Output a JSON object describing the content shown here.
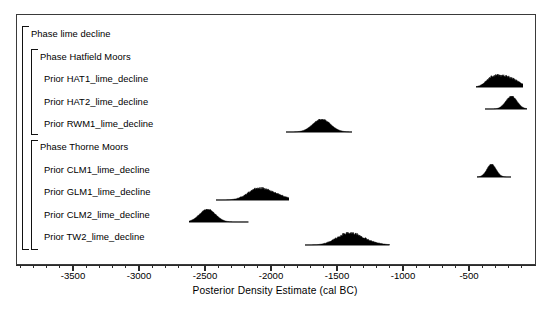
{
  "chart_data": {
    "type": "area",
    "title": "",
    "subtitle": "",
    "xlabel": "Posterior Density Estimate (cal BC)",
    "ylabel": "",
    "xlim": [
      -3900,
      -100
    ],
    "grid": false,
    "legend": "none",
    "axis": {
      "tick_labels": [
        "-3500",
        "-3000",
        "-2500",
        "-2000",
        "-1500",
        "-1000",
        "-500"
      ],
      "tick_values": [
        -3500,
        -3000,
        -2500,
        -2000,
        -1500,
        -1000,
        -500
      ],
      "minor_tick_step": 100
    },
    "rows": [
      {
        "label": "Phase lime decline",
        "kind": "phase",
        "level": 0,
        "has_density": false
      },
      {
        "label": "Phase Hatfield Moors",
        "kind": "phase",
        "level": 1,
        "has_density": false
      },
      {
        "label": "Prior HAT1_lime_decline",
        "kind": "prior",
        "level": 2,
        "has_density": true,
        "range": [
          -450,
          -90
        ],
        "peak": -270,
        "modes": [
          -330,
          -230,
          -160
        ],
        "shape": "multimodal"
      },
      {
        "label": "Prior HAT2_lime_decline",
        "kind": "prior",
        "level": 2,
        "has_density": true,
        "range": [
          -380,
          -60
        ],
        "peak": -180,
        "modes": [
          -180
        ],
        "shape": "unimodal"
      },
      {
        "label": "Prior RWM1_lime_decline",
        "kind": "prior",
        "level": 2,
        "has_density": true,
        "range": [
          -1890,
          -1390
        ],
        "peak": -1620,
        "modes": [
          -1620
        ],
        "shape": "unimodal"
      },
      {
        "label": "Phase Thorne Moors",
        "kind": "phase",
        "level": 1,
        "has_density": false
      },
      {
        "label": "Prior CLM1_lime_decline",
        "kind": "prior",
        "level": 2,
        "has_density": true,
        "range": [
          -440,
          -180
        ],
        "peak": -330,
        "modes": [
          -330
        ],
        "shape": "unimodal"
      },
      {
        "label": "Prior GLM1_lime_decline",
        "kind": "prior",
        "level": 2,
        "has_density": true,
        "range": [
          -2420,
          -1860
        ],
        "peak": -2060,
        "modes": [
          -2120,
          -2000
        ],
        "shape": "multimodal"
      },
      {
        "label": "Prior CLM2_lime_decline",
        "kind": "prior",
        "level": 2,
        "has_density": true,
        "range": [
          -2620,
          -2170
        ],
        "peak": -2480,
        "modes": [
          -2480
        ],
        "shape": "unimodal"
      },
      {
        "label": "Prior TW2_lime_decline",
        "kind": "prior",
        "level": 2,
        "has_density": true,
        "range": [
          -1740,
          -1100
        ],
        "peak": -1400,
        "modes": [
          -1430,
          -1340
        ],
        "shape": "multimodal"
      }
    ],
    "colors": {
      "density_fill": "#000000",
      "frame": "#3a3a3a",
      "axis": "#2a2a2a",
      "background": "#ffffff"
    }
  }
}
